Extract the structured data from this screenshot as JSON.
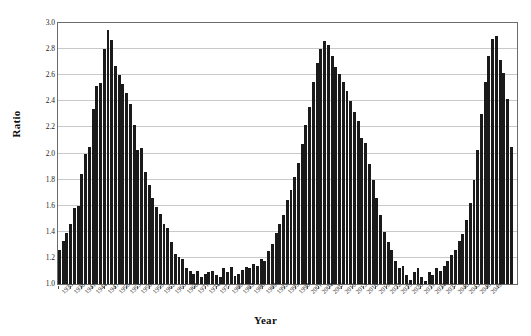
{
  "chart_data": {
    "type": "bar",
    "title": "",
    "xlabel": "Year",
    "ylabel": "Ratio",
    "ylim": [
      1.0,
      3.0
    ],
    "ytick_labels": [
      "3.0",
      "2.8",
      "2.6",
      "2.4",
      "2.2",
      "2.0",
      "1.8",
      "1.6",
      "1.4",
      "1.2",
      "1.0"
    ],
    "ytick_values": [
      3.0,
      2.8,
      2.6,
      2.4,
      2.2,
      2.0,
      1.8,
      1.6,
      1.4,
      1.2,
      1.0
    ],
    "grid": "horizontal",
    "legend": "none",
    "bar_color": "#1a1a1a",
    "xtick_step": 3,
    "xtick_labels": [
      "1935",
      "1938",
      "1941",
      "1944",
      "1947",
      "1950",
      "1953",
      "1956",
      "1959",
      "1962",
      "1965",
      "1968",
      "1971",
      "1974",
      "1977",
      "1980",
      "1983",
      "1986",
      "1989",
      "1992",
      "1995",
      "1998",
      "2001",
      "2004",
      "2007",
      "2010",
      "2013",
      "2016",
      "2019",
      "2022",
      "2025",
      "2028",
      "2031",
      "2034",
      "2037",
      "2040",
      "2043",
      "2046",
      "2049"
    ],
    "categories": [
      "1935",
      "1936",
      "1937",
      "1938",
      "1939",
      "1940",
      "1941",
      "1942",
      "1943",
      "1944",
      "1945",
      "1946",
      "1947",
      "1948",
      "1949",
      "1950",
      "1951",
      "1952",
      "1953",
      "1954",
      "1955",
      "1956",
      "1957",
      "1958",
      "1959",
      "1960",
      "1961",
      "1962",
      "1963",
      "1964",
      "1965",
      "1966",
      "1967",
      "1968",
      "1969",
      "1970",
      "1971",
      "1972",
      "1973",
      "1974",
      "1975",
      "1976",
      "1977",
      "1978",
      "1979",
      "1980",
      "1981",
      "1982",
      "1983",
      "1984",
      "1985",
      "1986",
      "1987",
      "1988",
      "1989",
      "1990",
      "1991",
      "1992",
      "1993",
      "1994",
      "1995",
      "1996",
      "1997",
      "1998",
      "1999",
      "2000",
      "2001",
      "2002",
      "2003",
      "2004",
      "2005",
      "2006",
      "2007",
      "2008",
      "2009",
      "2010",
      "2011",
      "2012",
      "2013",
      "2014",
      "2015",
      "2016",
      "2017",
      "2018",
      "2019",
      "2020",
      "2021",
      "2022",
      "2023",
      "2024",
      "2025",
      "2026",
      "2027",
      "2028",
      "2029",
      "2030",
      "2031",
      "2032",
      "2033",
      "2034",
      "2035",
      "2036",
      "2037",
      "2038",
      "2039",
      "2040",
      "2041",
      "2042",
      "2043",
      "2044",
      "2045",
      "2046",
      "2047",
      "2048",
      "2049",
      "2050"
    ],
    "values": [
      1.26,
      1.33,
      1.39,
      1.46,
      1.58,
      1.6,
      1.84,
      2.0,
      2.05,
      2.34,
      2.52,
      2.54,
      2.8,
      2.95,
      2.87,
      2.67,
      2.6,
      2.53,
      2.46,
      2.38,
      2.22,
      2.03,
      2.04,
      1.86,
      1.76,
      1.66,
      1.59,
      1.54,
      1.46,
      1.43,
      1.32,
      1.23,
      1.21,
      1.19,
      1.12,
      1.1,
      1.08,
      1.1,
      1.05,
      1.08,
      1.09,
      1.1,
      1.07,
      1.05,
      1.12,
      1.09,
      1.13,
      1.06,
      1.08,
      1.11,
      1.13,
      1.12,
      1.15,
      1.14,
      1.19,
      1.18,
      1.25,
      1.31,
      1.39,
      1.46,
      1.53,
      1.64,
      1.72,
      1.82,
      1.93,
      2.07,
      2.22,
      2.36,
      2.55,
      2.69,
      2.8,
      2.86,
      2.83,
      2.75,
      2.66,
      2.61,
      2.55,
      2.48,
      2.4,
      2.32,
      2.25,
      2.12,
      2.08,
      1.92,
      1.8,
      1.66,
      1.53,
      1.4,
      1.32,
      1.26,
      1.18,
      1.12,
      1.14,
      1.07,
      1.03,
      1.09,
      1.12,
      1.05,
      1.02,
      1.09,
      1.07,
      1.12,
      1.1,
      1.14,
      1.18,
      1.22,
      1.26,
      1.33,
      1.38,
      1.49,
      1.62,
      1.8,
      2.03,
      2.3,
      2.55,
      2.75
    ],
    "tail_values": [
      2.88,
      2.9,
      2.72,
      2.62,
      2.42,
      2.05
    ]
  },
  "axis": {
    "ylabel_text": "Ratio",
    "xlabel_text": "Year"
  }
}
